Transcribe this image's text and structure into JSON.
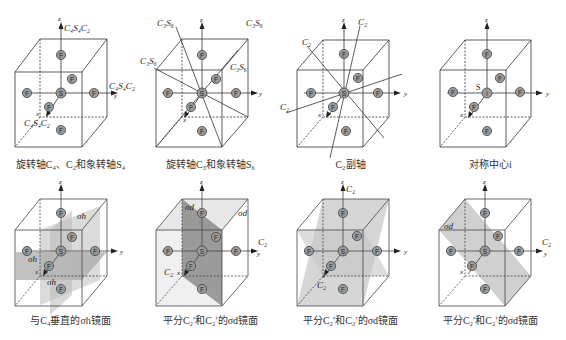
{
  "figure": {
    "atom_labels": {
      "central": "S",
      "ligand": "F",
      "center_inversion": "i"
    },
    "axis_labels": {
      "x": "x",
      "y": "y",
      "z": "z"
    },
    "colors": {
      "line": "#333333",
      "atom_fill": "#9a9a9a",
      "plane_dark": "#8c8c8c",
      "plane_light": "#cfcfcf",
      "background": "#ffffff"
    },
    "panels": [
      {
        "id": "c4-c2-s4",
        "caption": "旋转轴C₄、C₂和象转轴S₄",
        "axis_labels": {
          "z_top": "C₄S₄C₂",
          "y_right": "C₄S₄C₂",
          "x_front": "C₄S₄C₂"
        }
      },
      {
        "id": "c3-s6",
        "caption": "旋转轴C₃和象转轴S₆",
        "axis_labels": {
          "diag_1": "C₃S₆",
          "diag_2": "C₃S₆",
          "diag_3": "C₃S₆",
          "diag_4": "C₃S₆"
        }
      },
      {
        "id": "c2-subaxis",
        "caption": "C₂副轴",
        "axis_labels": {
          "c2_a": "C₂",
          "c2_b": "C₂",
          "c2_c": "C₂"
        }
      },
      {
        "id": "inversion-center",
        "caption": "对称中心i",
        "axis_labels": {
          "center": "S"
        }
      },
      {
        "id": "sigma-h",
        "caption": "与C₄垂直的σh镜面",
        "axis_labels": {
          "plane_1": "σh",
          "plane_2": "σh",
          "plane_3": "σh"
        }
      },
      {
        "id": "sigma-d-1",
        "caption": "平分C₂′和C₂′的σd镜面",
        "axis_labels": {
          "plane_1": "σd",
          "plane_2": "σd",
          "c2_y": "C₂",
          "c2_x": "C₂"
        }
      },
      {
        "id": "sigma-d-2",
        "caption": "平分C₂′和C₂′的σd镜面",
        "axis_labels": {
          "c2_z": "C₂",
          "c2_x": "C₂"
        }
      },
      {
        "id": "sigma-d-3",
        "caption": "平分C₂′和C₂′的σd镜面",
        "axis_labels": {
          "plane_1": "σd",
          "c2_y": "C₂"
        }
      }
    ]
  }
}
